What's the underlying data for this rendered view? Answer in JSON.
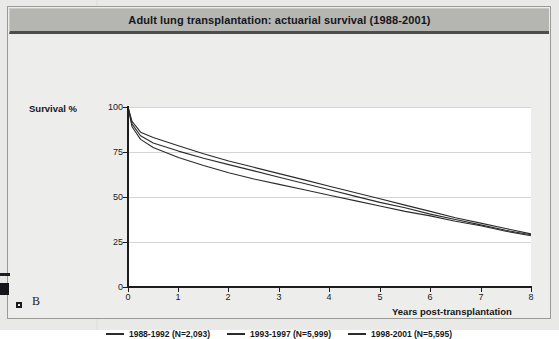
{
  "figure": {
    "title": "Adult lung transplantation: actuarial survival (1988-2001)",
    "panel_letter": "B",
    "title_bar_color": "#b5b5b2",
    "plot_background": "#ffffff",
    "line_color": "#2b2b2b",
    "gridline_color": "#d4d4d4",
    "axis_color": "#1c1c1c"
  },
  "chart_data": {
    "type": "line",
    "title": "Adult lung transplantation: actuarial survival (1988-2001)",
    "xlabel": "Years post-transplantation",
    "ylabel": "Survival %",
    "xlim": [
      0,
      8
    ],
    "ylim": [
      0,
      100
    ],
    "xticks": [
      "0",
      "1",
      "2",
      "3",
      "4",
      "5",
      "6",
      "7",
      "8"
    ],
    "yticks": [
      "0",
      "25",
      "50",
      "75",
      "100"
    ],
    "grid": "horizontal",
    "legend_position": "bottom",
    "x": [
      0,
      0.08,
      0.25,
      0.5,
      1,
      1.5,
      2,
      2.5,
      3,
      3.5,
      4,
      4.5,
      5,
      5.5,
      6,
      6.5,
      7,
      7.5,
      8
    ],
    "series": [
      {
        "name": "1988-1992 (N=2,093)",
        "label": "1988-1992",
        "n": "N=2,093",
        "values": [
          100,
          92,
          86,
          83,
          78.5,
          74,
          70,
          66.5,
          63,
          59.5,
          56,
          52.5,
          49,
          45.5,
          42,
          38.5,
          35.5,
          32.5,
          29.5
        ]
      },
      {
        "name": "1993-1997 (N=5,999)",
        "label": "1993-1997",
        "n": "N=5,999",
        "values": [
          100,
          90.5,
          84,
          80,
          75.5,
          71.5,
          68,
          64.5,
          61,
          57.5,
          54,
          50.5,
          47,
          44,
          40.5,
          37.5,
          34.5,
          31.5,
          29
        ]
      },
      {
        "name": "1998-2001 (N=5,595)",
        "label": "1998-2001",
        "n": "N=5,595",
        "values": [
          100,
          89,
          82,
          77.5,
          72,
          67.5,
          63.5,
          60,
          57,
          54,
          51,
          48,
          45,
          42,
          39.5,
          36.5,
          34,
          31,
          28.5
        ]
      }
    ]
  },
  "axis": {
    "y_title": "Survival %",
    "x_title": "Years post-transplantation"
  }
}
